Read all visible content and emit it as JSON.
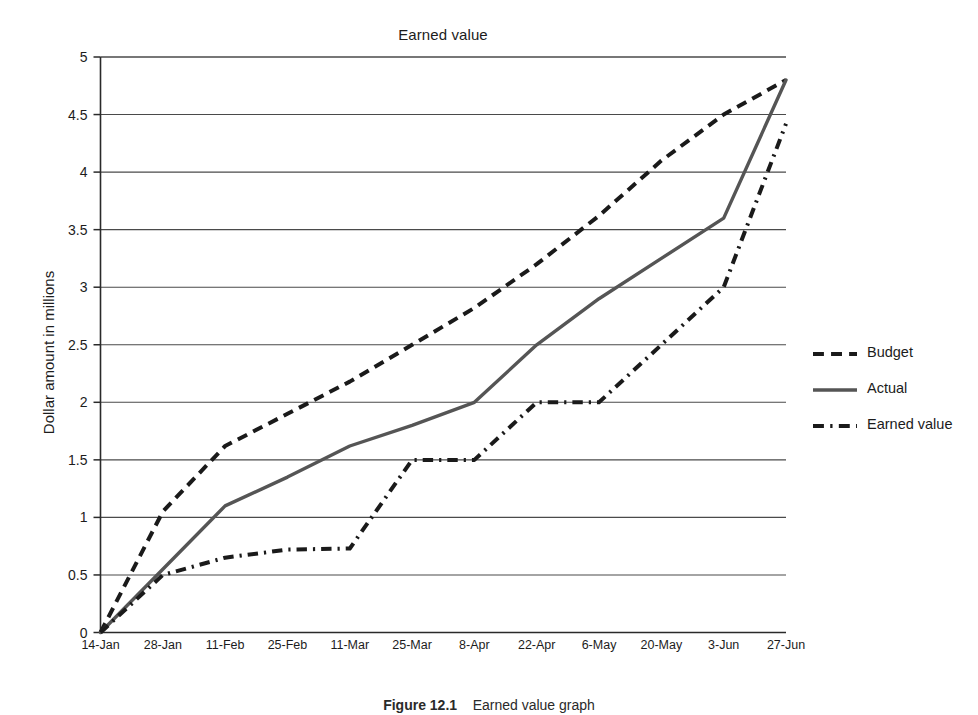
{
  "figure": {
    "caption_label": "Figure 12.1",
    "caption_text": "Earned value graph"
  },
  "chart_data": {
    "type": "line",
    "title": "Earned value",
    "xlabel": "Date",
    "ylabel": "Dollar amount in millions",
    "categories": [
      "14-Jan",
      "28-Jan",
      "11-Feb",
      "25-Feb",
      "11-Mar",
      "25-Mar",
      "8-Apr",
      "22-Apr",
      "6-May",
      "20-May",
      "3-Jun",
      "27-Jun"
    ],
    "ylim": [
      0,
      5
    ],
    "yticks": [
      0,
      0.5,
      1,
      1.5,
      2,
      2.5,
      3,
      3.5,
      4,
      4.5,
      5
    ],
    "ytick_labels": [
      "0",
      "0.5",
      "1",
      "1.5",
      "2",
      "2.5",
      "3",
      "3.5",
      "4",
      "4.5",
      "5"
    ],
    "grid": "horizontal",
    "legend_position": "right",
    "series": [
      {
        "name": "Budget",
        "style": "dashed",
        "color": "#1a1a1a",
        "values": [
          0,
          1.05,
          1.62,
          1.9,
          2.18,
          2.5,
          2.82,
          3.2,
          3.62,
          4.1,
          4.5,
          4.8
        ]
      },
      {
        "name": "Actual",
        "style": "solid",
        "color": "#555555",
        "values": [
          0,
          0.55,
          1.1,
          1.35,
          1.62,
          1.8,
          2.0,
          2.5,
          2.9,
          3.25,
          3.6,
          4.8
        ]
      },
      {
        "name": "Earned value",
        "style": "dash-dot",
        "color": "#1a1a1a",
        "values": [
          0,
          0.5,
          0.65,
          0.72,
          0.73,
          1.5,
          1.5,
          2.0,
          2.0,
          2.5,
          3.0,
          4.42
        ]
      }
    ]
  }
}
